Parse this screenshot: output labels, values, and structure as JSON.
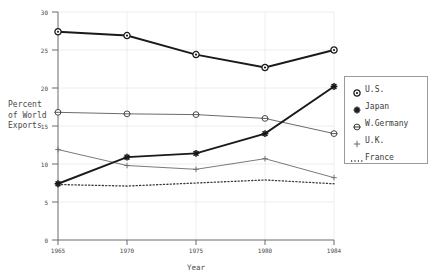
{
  "chart_data": {
    "type": "line",
    "title": "",
    "xlabel": "Year",
    "ylabel": "Percent\nof World\nExports",
    "ylabel_lines": [
      "Percent",
      "of World",
      "Exports"
    ],
    "x": [
      1965,
      1970,
      1975,
      1980,
      1984
    ],
    "categories": [
      "1965",
      "1970",
      "1975",
      "1980",
      "1984"
    ],
    "xtick_labels": [
      "1965",
      "1970",
      "1975",
      "1980",
      "1984"
    ],
    "ytick_labels": [
      "0",
      "5",
      "10",
      "15",
      "20",
      "25",
      "30"
    ],
    "ytick_values": [
      0,
      5,
      10,
      15,
      20,
      25,
      30
    ],
    "xlim": [
      1965,
      1984
    ],
    "ylim": [
      0,
      30
    ],
    "grid": true,
    "legend_position": "right",
    "series": [
      {
        "name": "U.S.",
        "marker": "circle-dot",
        "line": "solid-thick",
        "color": "#1a1a1a",
        "values": [
          27.4,
          26.9,
          24.4,
          22.7,
          25.0
        ]
      },
      {
        "name": "Japan",
        "marker": "star",
        "line": "solid-thick",
        "color": "#1a1a1a",
        "values": [
          7.4,
          10.9,
          11.4,
          14.0,
          20.2
        ]
      },
      {
        "name": "W.Germany",
        "marker": "circle-cross",
        "line": "solid-thin",
        "color": "#5a5a5a",
        "values": [
          16.8,
          16.6,
          16.5,
          16.0,
          14.0
        ]
      },
      {
        "name": "U.K.",
        "marker": "plus",
        "line": "solid-thin",
        "color": "#6a6a6a",
        "values": [
          11.9,
          9.8,
          9.3,
          10.7,
          8.2
        ]
      },
      {
        "name": "France",
        "marker": "none",
        "line": "dotted",
        "color": "#4a4a4a",
        "values": [
          7.3,
          7.1,
          7.5,
          7.9,
          7.4
        ]
      }
    ]
  },
  "legend": {
    "items": [
      {
        "label": "U.S.",
        "marker": "circle-dot-icon"
      },
      {
        "label": "Japan",
        "marker": "star-icon"
      },
      {
        "label": "W.Germany",
        "marker": "circle-cross-icon"
      },
      {
        "label": "U.K.",
        "marker": "plus-icon"
      },
      {
        "label": "France",
        "marker": "dotted-line-icon"
      }
    ]
  },
  "axes": {
    "x_title": "Year",
    "y_title_line1": "Percent",
    "y_title_line2": "of World",
    "y_title_line3": "Exports"
  },
  "colors": {
    "background": "#ffffff",
    "axis": "#6a6a6a",
    "grid": "#e2e2e2",
    "text": "#4a4a4a",
    "emphasis": "#1a1a1a",
    "secondary": "#6a6a6a"
  }
}
